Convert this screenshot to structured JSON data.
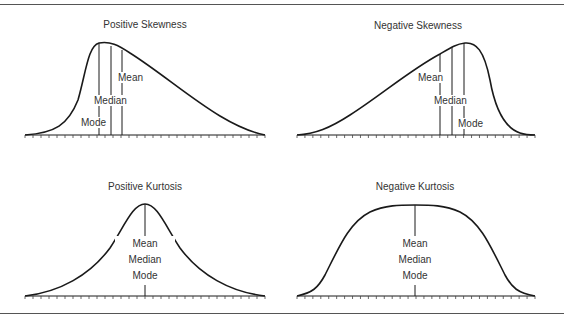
{
  "panels": {
    "positive_skewness": {
      "title": "Positive Skewness",
      "labels": {
        "mean": "Mean",
        "median": "Median",
        "mode": "Mode"
      }
    },
    "negative_skewness": {
      "title": "Negative Skewness",
      "labels": {
        "mean": "Mean",
        "median": "Median",
        "mode": "Mode"
      }
    },
    "positive_kurtosis": {
      "title": "Positive Kurtosis",
      "labels": {
        "mean": "Mean",
        "median": "Median",
        "mode": "Mode"
      }
    },
    "negative_kurtosis": {
      "title": "Negative Kurtosis",
      "labels": {
        "mean": "Mean",
        "median": "Median",
        "mode": "Mode"
      }
    }
  },
  "colors": {
    "line": "#1a1a1a",
    "rule": "#555555",
    "background": "#ffffff"
  }
}
